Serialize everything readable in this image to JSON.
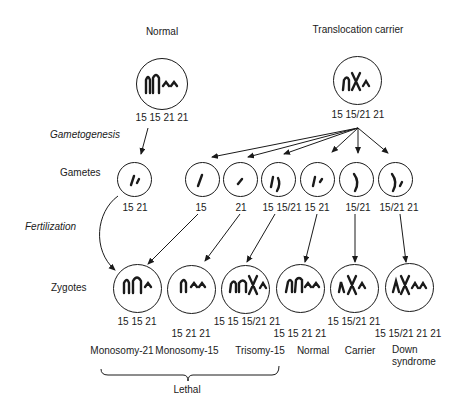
{
  "parents": {
    "normal": {
      "title": "Normal",
      "karyotype": "15 15 21 21"
    },
    "carrier": {
      "title": "Translocation carrier",
      "karyotype": "15 15/21 21"
    }
  },
  "row_labels": {
    "gametogenesis": "Gametogenesis",
    "gametes": "Gametes",
    "fertilization": "Fertilization",
    "zygotes": "Zygotes"
  },
  "gametes": [
    {
      "source": "normal",
      "karyotype": "15 21"
    },
    {
      "source": "carrier",
      "karyotype": "15"
    },
    {
      "source": "carrier",
      "karyotype": "21"
    },
    {
      "source": "carrier",
      "karyotype": "15 15/21"
    },
    {
      "source": "carrier",
      "karyotype": "15 21"
    },
    {
      "source": "carrier",
      "karyotype": "15/21"
    },
    {
      "source": "carrier",
      "karyotype": "15/21 21"
    }
  ],
  "zygotes": [
    {
      "karyotype": "15 15 21",
      "outcome": "Monosomy-21"
    },
    {
      "karyotype": "15 21 21",
      "outcome": "Monosomy-15"
    },
    {
      "karyotype": "15 15 15/21 21",
      "outcome": "Trisomy-15"
    },
    {
      "karyotype": "15 15 21 21",
      "outcome": "Normal"
    },
    {
      "karyotype": "15 15/21 21",
      "outcome": "Carrier"
    },
    {
      "karyotype": "15 15/21 21 21",
      "outcome": "Down syndrome",
      "outcome_line1": "Down",
      "outcome_line2": "syndrome"
    }
  ],
  "bracket_label": "Lethal",
  "colors": {
    "ink": "#1a1a1a",
    "background": "#ffffff"
  }
}
